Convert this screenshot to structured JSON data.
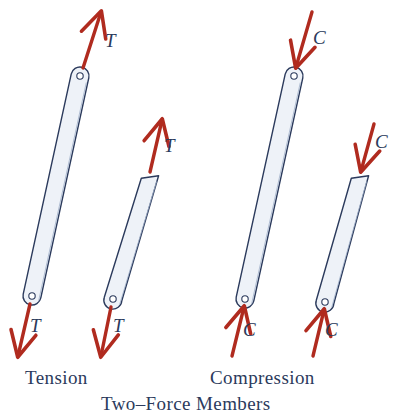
{
  "figure": {
    "caption": "Two–Force Members",
    "groups": [
      {
        "id": "tension",
        "label": "Tension"
      },
      {
        "id": "compression",
        "label": "Compression"
      }
    ],
    "colors": {
      "force_arrow": "#b02b1f",
      "member_outline": "#2b3a5c",
      "member_fill": "#eef2f8",
      "label_text": "#2b3a5c",
      "background": "#ffffff"
    },
    "force_labels": {
      "tension_symbol": "T",
      "compression_symbol": "C"
    },
    "members": [
      {
        "name": "tension-member-rounded",
        "group": "tension",
        "end_type_top": "rounded-pin",
        "end_type_bottom": "rounded-pin",
        "top_force_label": "T",
        "top_force_direction": "away-from-member",
        "bottom_force_label": "T",
        "bottom_force_direction": "away-from-member"
      },
      {
        "name": "tension-member-flat",
        "group": "tension",
        "end_type_top": "flat-cut",
        "end_type_bottom": "rounded-pin",
        "top_force_label": "T",
        "top_force_direction": "away-from-member",
        "bottom_force_label": "T",
        "bottom_force_direction": "away-from-member"
      },
      {
        "name": "compression-member-rounded",
        "group": "compression",
        "end_type_top": "rounded-pin",
        "end_type_bottom": "rounded-pin",
        "top_force_label": "C",
        "top_force_direction": "into-member",
        "bottom_force_label": "C",
        "bottom_force_direction": "into-member"
      },
      {
        "name": "compression-member-flat",
        "group": "compression",
        "end_type_top": "flat-cut",
        "end_type_bottom": "rounded-pin",
        "top_force_label": "C",
        "top_force_direction": "into-member",
        "bottom_force_label": "C",
        "bottom_force_direction": "into-member"
      }
    ],
    "annotations": {
      "t1_top": "T",
      "t1_bottom": "T",
      "t2_top": "T",
      "t2_bottom": "T",
      "c1_top": "C",
      "c1_bottom": "C",
      "c2_top": "C",
      "c2_bottom": "C"
    }
  }
}
